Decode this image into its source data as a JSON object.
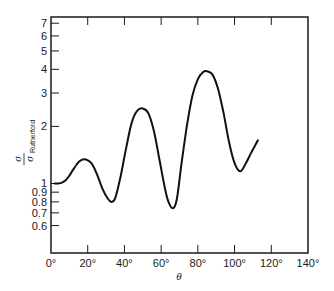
{
  "chart_data": {
    "type": "line",
    "title": "",
    "xlabel": "θ",
    "ylabel": "σ / σ_Rutherford",
    "ylabel_parts": {
      "numerator": "σ",
      "denominator": "σ",
      "subscript": "Rutherford"
    },
    "xscale": "linear",
    "yscale": "log",
    "xlim": [
      0,
      140
    ],
    "ylim": [
      0.43,
      7.55
    ],
    "grid": false,
    "legend": null,
    "x_ticks": [
      0,
      20,
      40,
      60,
      80,
      100,
      120,
      140
    ],
    "x_tick_labels": [
      "0°",
      "20°",
      "40°",
      "60°",
      "80°",
      "100°",
      "120°",
      "140°"
    ],
    "y_ticks": [
      0.6,
      0.7,
      0.8,
      0.9,
      1,
      2,
      3,
      4,
      5,
      6,
      7
    ],
    "y_tick_labels": [
      "0.6",
      "0.7",
      "0.8",
      "0.9",
      "1",
      "2",
      "3",
      "4",
      "5",
      "6",
      "7"
    ],
    "series": [
      {
        "name": "σ/σ_Rutherford",
        "color": "#111111",
        "x": [
          2,
          4,
          6,
          8,
          10,
          12,
          14,
          16,
          19,
          22,
          25,
          28,
          31,
          33,
          35,
          38,
          41,
          44,
          47,
          50,
          53,
          56,
          59,
          62,
          64,
          66.4,
          68.5,
          71,
          74,
          77,
          80,
          83,
          85,
          88,
          91,
          94,
          97,
          100,
          103,
          106,
          109,
          112.7
        ],
        "y": [
          1.0,
          1.0,
          1.01,
          1.04,
          1.1,
          1.18,
          1.26,
          1.32,
          1.34,
          1.28,
          1.12,
          0.94,
          0.83,
          0.8,
          0.84,
          1.1,
          1.55,
          2.1,
          2.42,
          2.49,
          2.35,
          1.9,
          1.35,
          0.95,
          0.8,
          0.74,
          0.82,
          1.25,
          2.0,
          2.9,
          3.55,
          3.88,
          3.91,
          3.75,
          3.15,
          2.35,
          1.65,
          1.28,
          1.16,
          1.27,
          1.45,
          1.69
        ]
      }
    ],
    "peaks": [
      {
        "theta": 19,
        "value": 1.34
      },
      {
        "theta": 50,
        "value": 2.49
      },
      {
        "theta": 85,
        "value": 3.91
      }
    ],
    "minima": [
      {
        "theta": 33,
        "value": 0.8
      },
      {
        "theta": 66,
        "value": 0.74
      },
      {
        "theta": 103,
        "value": 1.16
      }
    ]
  }
}
